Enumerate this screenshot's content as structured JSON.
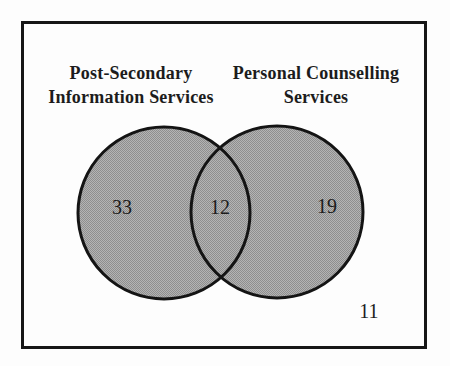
{
  "figure": {
    "left_set": {
      "title_line1": "Post-Secondary",
      "title_line2": "Information Services",
      "only_count": "33"
    },
    "right_set": {
      "title_line1": "Personal Counselling",
      "title_line2": "Services",
      "only_count": "19"
    },
    "intersection_count": "12",
    "outside_count": "11",
    "colors": {
      "circle_fill_light": "#b4b4b4",
      "circle_fill_dark": "#8e8e8e",
      "circle_outline": "#141414",
      "frame_border": "#161616",
      "text": "#1c1c1c",
      "background": "#fdfdfd"
    }
  }
}
